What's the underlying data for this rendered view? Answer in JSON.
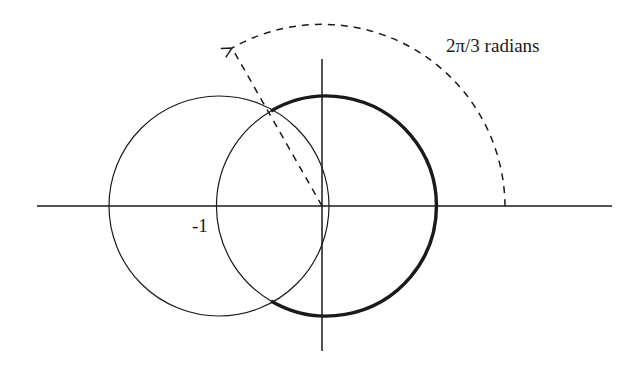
{
  "figure": {
    "angle_label": "2π/3 radians",
    "point_label": "-1",
    "colors": {
      "background": "#ffffff",
      "stroke": "#1a1a1a"
    },
    "geometry": {
      "origin": [
        322,
        206
      ],
      "unit_radius_px": 110,
      "left_circle_center": [
        219,
        206
      ],
      "right_circle_center": [
        322,
        206
      ],
      "angle_arc_radius_px": 183,
      "angle_degrees": 120,
      "x_axis": [
        37,
        612
      ],
      "y_axis": [
        59,
        351
      ]
    },
    "elements": [
      {
        "name": "x-axis",
        "type": "line"
      },
      {
        "name": "y-axis",
        "type": "line"
      },
      {
        "name": "left-circle",
        "type": "circle",
        "style": "thin"
      },
      {
        "name": "right-circle",
        "type": "circle",
        "style": "thin-inside, bold-outside"
      },
      {
        "name": "angle-ray",
        "type": "dashed-line"
      },
      {
        "name": "angle-arc",
        "type": "dashed-arc-with-arrow"
      }
    ]
  }
}
